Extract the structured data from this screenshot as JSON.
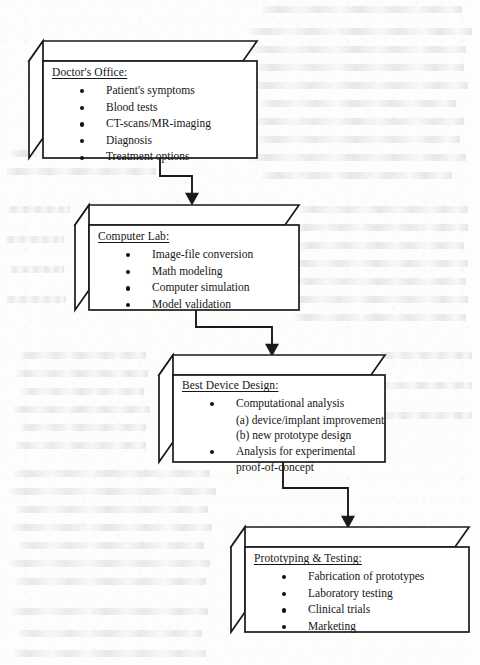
{
  "document": {
    "type": "scanned-page-flowchart",
    "title": "Medical Device Design Workflow",
    "background_color": "#fdfdfc",
    "ink_color": "#151515"
  },
  "flowchart": {
    "orientation": "top-to-bottom-staircase",
    "connector_style": "orthogonal-arrow",
    "box_style": "3d-extruded-rectangle",
    "nodes": [
      {
        "id": "doctors-office",
        "title": "Doctor's Office:",
        "items": [
          {
            "text": "Patient's symptoms",
            "kind": "bullet"
          },
          {
            "text": "Blood tests",
            "kind": "bullet"
          },
          {
            "text": "CT-scans/MR-imaging",
            "kind": "bullet"
          },
          {
            "text": "Diagnosis",
            "kind": "bullet"
          },
          {
            "text": "Treatment options",
            "kind": "bullet"
          }
        ]
      },
      {
        "id": "computer-lab",
        "title": "Computer Lab:",
        "items": [
          {
            "text": "Image-file conversion",
            "kind": "bullet"
          },
          {
            "text": "Math modeling",
            "kind": "bullet"
          },
          {
            "text": "Computer simulation",
            "kind": "bullet"
          },
          {
            "text": "Model validation",
            "kind": "bullet"
          }
        ]
      },
      {
        "id": "best-device-design",
        "title": "Best Device Design:",
        "items": [
          {
            "text": "Computational analysis",
            "kind": "bullet"
          },
          {
            "text": "(a) device/implant improvement",
            "kind": "sub"
          },
          {
            "text": "(b) new prototype design",
            "kind": "sub"
          },
          {
            "text": "Analysis for experimental",
            "kind": "bullet"
          },
          {
            "text": "proof-of-concept",
            "kind": "cont"
          }
        ]
      },
      {
        "id": "prototyping-testing",
        "title": "Prototyping & Testing:",
        "items": [
          {
            "text": "Fabrication of prototypes",
            "kind": "bullet"
          },
          {
            "text": "Laboratory testing",
            "kind": "bullet"
          },
          {
            "text": "Clinical trials",
            "kind": "bullet"
          },
          {
            "text": "Marketing",
            "kind": "bullet"
          }
        ]
      }
    ],
    "edges": [
      {
        "from": "doctors-office",
        "to": "computer-lab"
      },
      {
        "from": "computer-lab",
        "to": "best-device-design"
      },
      {
        "from": "best-device-design",
        "to": "prototyping-testing"
      }
    ]
  }
}
